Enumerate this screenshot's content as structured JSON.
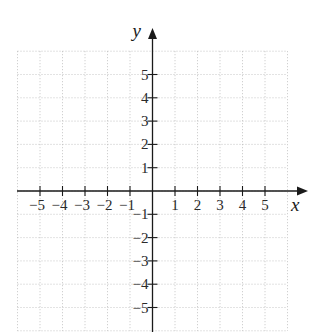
{
  "chart_data": {
    "type": "scatter",
    "title": "",
    "xlabel": "x",
    "ylabel": "y",
    "xlim": [
      -6,
      6
    ],
    "ylim": [
      -6,
      6
    ],
    "grid": true,
    "grid_style": "dotted",
    "x_ticks": [
      -5,
      -4,
      -3,
      -2,
      -1,
      1,
      2,
      3,
      4,
      5
    ],
    "y_ticks": [
      5,
      4,
      3,
      2,
      1,
      -1,
      -2,
      -3,
      -4,
      -5
    ],
    "x_tick_labels": [
      "−5",
      "−4",
      "−3",
      "−2",
      "−1",
      "1",
      "2",
      "3",
      "4",
      "5"
    ],
    "y_tick_labels": [
      "5",
      "4",
      "3",
      "2",
      "1",
      "−1",
      "−2",
      "−3",
      "−4",
      "−5"
    ],
    "series": [],
    "legend": null
  },
  "colors": {
    "axis": "#1a1a1a",
    "grid": "#b8b8b8",
    "background": "#ffffff"
  },
  "layout": {
    "origin_x": 152.5,
    "origin_y": 191,
    "unit_x": 22.5,
    "unit_y": 23.3,
    "x_axis_start": 17,
    "x_arrow_tip": 308,
    "y_axis_end": 332,
    "y_arrow_tip": 28
  }
}
